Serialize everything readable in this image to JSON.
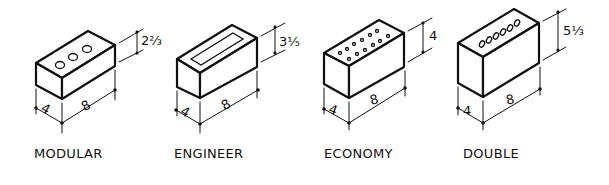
{
  "diagram": {
    "bricks": [
      {
        "name": "MODULAR",
        "width": "4",
        "length": "8",
        "height": "2⅔",
        "top_pattern": "3 round cores"
      },
      {
        "name": "ENGINEER",
        "width": "4",
        "length": "8",
        "height": "3⅕",
        "top_pattern": "single rectangular frog"
      },
      {
        "name": "ECONOMY",
        "width": "4",
        "length": "8",
        "height": "4",
        "top_pattern": "12 small holes in 2 rows"
      },
      {
        "name": "DOUBLE",
        "width": "4",
        "length": "8",
        "height": "5⅓",
        "top_pattern": "6 oval cores in a row"
      }
    ]
  }
}
